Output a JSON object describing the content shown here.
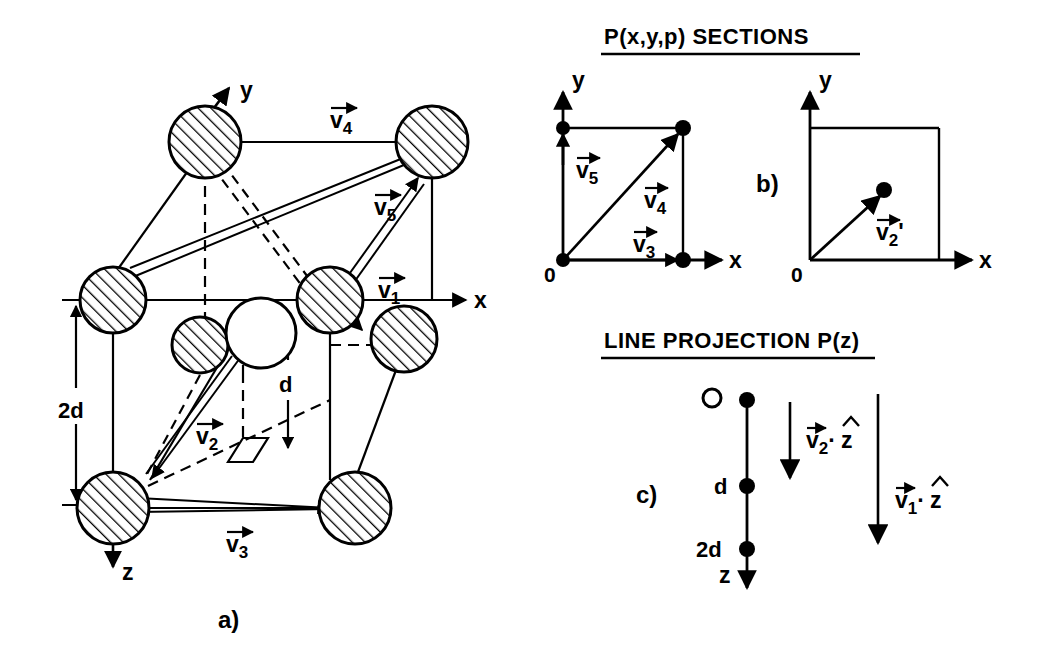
{
  "figure": {
    "background_color": "#ffffff",
    "ink_color": "#000000",
    "panels": [
      {
        "id": "a",
        "label": "a)"
      },
      {
        "id": "b",
        "label": "b)"
      },
      {
        "id": "c",
        "label": "c)"
      }
    ]
  },
  "panel_a": {
    "name": "crystal-lattice-unit-cell",
    "axes": [
      {
        "name": "x",
        "label": "x"
      },
      {
        "name": "y",
        "label": "y"
      },
      {
        "name": "z",
        "label": "z"
      }
    ],
    "dimensions": [
      {
        "label": "2d",
        "name": "two-d-dimension"
      },
      {
        "label": "d",
        "name": "d-dimension"
      }
    ],
    "vectors": [
      {
        "symbol": "v",
        "sub": "1",
        "label": "v1"
      },
      {
        "symbol": "v",
        "sub": "2",
        "label": "v2"
      },
      {
        "symbol": "v",
        "sub": "3",
        "label": "v3"
      },
      {
        "symbol": "v",
        "sub": "4",
        "label": "v4"
      },
      {
        "symbol": "v",
        "sub": "5",
        "label": "v5"
      }
    ],
    "atoms_hatched_count": 9,
    "atoms_open_count": 1,
    "panel_label": "a)"
  },
  "panel_b": {
    "name": "p-xyp-sections",
    "title": "P(x,y,p) SECTIONS",
    "panel_label": "b)",
    "left_square": {
      "origin_label": "0",
      "x_axis_label": "x",
      "y_axis_label": "y",
      "vectors": [
        {
          "symbol": "v",
          "sub": "5",
          "label": "v5"
        },
        {
          "symbol": "v",
          "sub": "4",
          "label": "v4"
        },
        {
          "symbol": "v",
          "sub": "3",
          "label": "v3"
        }
      ],
      "peaks": 4
    },
    "right_square": {
      "origin_label": "0",
      "x_axis_label": "x",
      "y_axis_label": "y",
      "vectors": [
        {
          "symbol": "v",
          "sub": "2",
          "prime": "'",
          "label": "v2'"
        }
      ],
      "peaks": 1
    }
  },
  "panel_c": {
    "name": "line-projection-pz",
    "title": "LINE PROJECTION P(z)",
    "panel_label": "c)",
    "axis_label": "z",
    "tick_labels": [
      {
        "label": "O",
        "name": "origin-open-circle"
      },
      {
        "label": "d",
        "name": "tick-d"
      },
      {
        "label": "2d",
        "name": "tick-2d"
      }
    ],
    "vectors": [
      {
        "symbol": "v",
        "sub": "2",
        "dot": "·",
        "unit": "z",
        "label": "v2 . z-hat"
      },
      {
        "symbol": "v",
        "sub": "1",
        "dot": "·",
        "unit": "z",
        "label": "v1 . z-hat"
      }
    ]
  }
}
